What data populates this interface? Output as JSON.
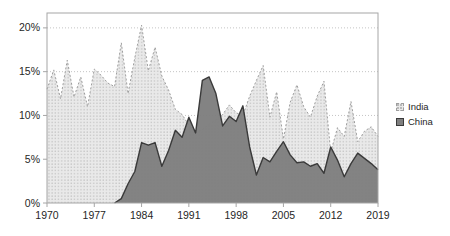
{
  "chart_data": {
    "type": "area",
    "title": "",
    "x": [
      1970,
      1971,
      1972,
      1973,
      1974,
      1975,
      1976,
      1977,
      1978,
      1979,
      1980,
      1981,
      1982,
      1983,
      1984,
      1985,
      1986,
      1987,
      1988,
      1989,
      1990,
      1991,
      1992,
      1993,
      1994,
      1995,
      1996,
      1997,
      1998,
      1999,
      2000,
      2001,
      2002,
      2003,
      2004,
      2005,
      2006,
      2007,
      2008,
      2009,
      2010,
      2011,
      2012,
      2013,
      2014,
      2015,
      2016,
      2017,
      2018,
      2019
    ],
    "x_tick_years": [
      1970,
      1977,
      1984,
      1991,
      1998,
      2005,
      2012,
      2019
    ],
    "x_tick_labels": [
      "1970",
      "1977",
      "1984",
      "1991",
      "1998",
      "2005",
      "2012",
      "2019"
    ],
    "y_ticks": [
      0,
      5,
      10,
      15,
      20
    ],
    "y_tick_labels": [
      "0%",
      "5%",
      "10%",
      "15%",
      "20%"
    ],
    "ylim": [
      0,
      21.7
    ],
    "grid": true,
    "legend_position": "right",
    "series": [
      {
        "name": "India",
        "values": [
          13,
          15.2,
          11.9,
          16.3,
          12.1,
          14.4,
          11,
          15.3,
          14.6,
          13.7,
          13.3,
          18.3,
          12.5,
          16.6,
          20.3,
          15.1,
          17.8,
          14.5,
          12.9,
          10.7,
          10.1,
          8.9,
          8,
          8.4,
          9,
          9.5,
          10.1,
          11.2,
          10.3,
          10,
          12.2,
          14,
          15.7,
          9.8,
          12.7,
          7.3,
          11.5,
          13.5,
          11,
          9.8,
          12.2,
          13.9,
          5.8,
          8.6,
          7.6,
          11.6,
          7,
          8.2,
          8.7,
          7.6
        ],
        "fill": "#e9e9e9",
        "fill_pattern": "dots",
        "dot_color": "#b9b9b9",
        "line_color": "#9e9e9e",
        "line_style": "dashed"
      },
      {
        "name": "China",
        "values": [
          0,
          0,
          0,
          0,
          0,
          0,
          0,
          0,
          0,
          0,
          0,
          0.5,
          2.2,
          3.6,
          6.9,
          6.6,
          6.9,
          4.2,
          6,
          8.3,
          7.5,
          9.8,
          8,
          14,
          14.4,
          12.5,
          8.8,
          9.9,
          9.3,
          11.1,
          6.4,
          3.2,
          5.2,
          4.7,
          5.9,
          7,
          5.5,
          4.6,
          4.7,
          4.2,
          4.5,
          3.4,
          6.4,
          4.9,
          3,
          4.5,
          5.7,
          5.1,
          4.5,
          3.8
        ],
        "fill": "#7f7f7f",
        "fill_pattern": "solid",
        "line_color": "#3a3a3a",
        "line_style": "solid"
      }
    ],
    "colors": {
      "plot_border": "#a6a6a6",
      "gridline": "#c4c4c4",
      "axis_text": "#262626",
      "background": "#ffffff"
    }
  }
}
